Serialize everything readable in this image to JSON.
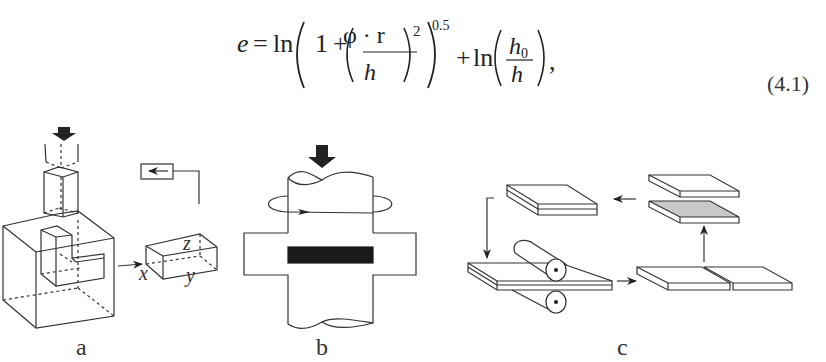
{
  "equation": {
    "lhs": "e",
    "equals": "=",
    "ln1": "ln",
    "one": "1",
    "plus1": "+",
    "numerator": "φ · r",
    "denominator": "h",
    "inner_exponent": "2",
    "outer_exponent": "0.5",
    "plus2": "+",
    "ln2": "ln",
    "numerator2": "h",
    "numerator2_sub": "0",
    "denominator2": "h",
    "trailing": ",",
    "number": "(4.1)"
  },
  "figures": {
    "a": {
      "label": "a",
      "axes": {
        "x": "x",
        "y": "y",
        "z": "z"
      }
    },
    "b": {
      "label": "b"
    },
    "c": {
      "label": "c"
    }
  },
  "colors": {
    "line": "#333333",
    "fill_dark": "#1a1a1a",
    "fill_gray": "#c8c8c8"
  }
}
